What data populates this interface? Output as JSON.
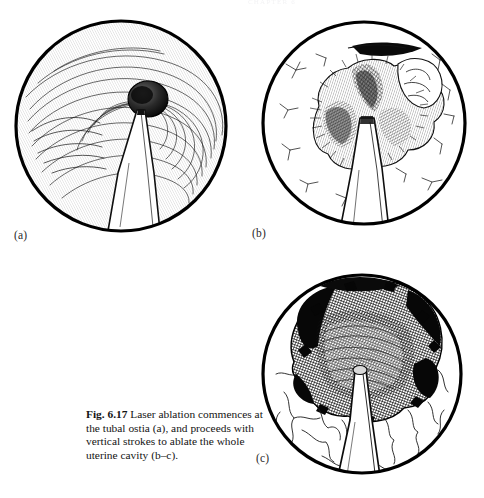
{
  "page": {
    "running_head": "CHAPTER 6",
    "background_color": "#ffffff",
    "ink_color": "#111111"
  },
  "figure": {
    "number": "Fig. 6.17",
    "caption_text": "Laser ablation commences at the tubal ostia (a), and proceeds with vertical strokes to ablate the whole uterine cavity (b–c).",
    "caption_lines": [
      "Fig. 6.17  Laser ablation",
      "commences at the tubal ostia",
      "(a), and proceeds with vertical",
      "strokes to ablate the whole",
      "uterine cavity (b–c)."
    ],
    "panels": [
      {
        "id": "a",
        "label": "(a)",
        "title": "Laser fibre at tubal ostium",
        "description": "Hysteroscopic view of uterine cavity with concentric striated endometrium and a dark round tubal ostium; laser fibre tip approaches the ostium from below.",
        "shape": "circle",
        "center_x": 121,
        "center_y": 126,
        "radius": 107
      },
      {
        "id": "b",
        "label": "(b)",
        "title": "Vertical ablation strokes begin",
        "description": "Hysteroscopic view showing an irregular crater of ablated endometrium around the laser fibre, with ragged darkened furrows and surrounding intact surface.",
        "shape": "circle",
        "center_x": 364,
        "center_y": 126,
        "radius": 104
      },
      {
        "id": "c",
        "label": "(c)",
        "title": "Whole cavity ablated",
        "description": "Hysteroscopic view with a large dense dark ablated field filling the upper cavity, the laser fibre advancing vertically through the centre.",
        "shape": "circle",
        "center_x": 362,
        "center_y": 374,
        "radius": 100
      }
    ]
  }
}
